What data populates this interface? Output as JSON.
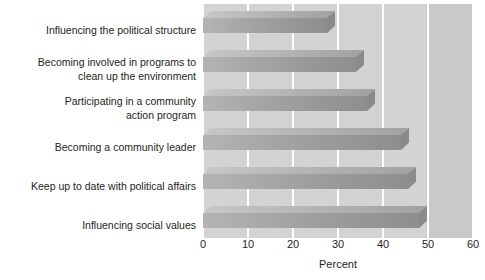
{
  "chart_data": {
    "type": "bar",
    "orientation": "horizontal",
    "title": "",
    "xlabel": "Percent",
    "ylabel": "",
    "xlim": [
      0,
      60
    ],
    "xticks": [
      0,
      10,
      20,
      30,
      40,
      50,
      60
    ],
    "grid": true,
    "legend": false,
    "categories": [
      "Influencing the political structure",
      "Becoming involved in programs to clean up the environment",
      "Participating in a community action program",
      "Becoming a community leader",
      "Keep up to date with political affairs",
      "Influencing social values"
    ],
    "category_lines": [
      [
        "Influencing the political structure"
      ],
      [
        "Becoming involved in programs to",
        "clean up the environment"
      ],
      [
        "Participating in a community",
        "action program"
      ],
      [
        "Becoming a community leader"
      ],
      [
        "Keep up to date with political affairs"
      ],
      [
        "Influencing social values"
      ]
    ],
    "values": [
      27.5,
      34,
      36.5,
      44,
      45.5,
      48
    ]
  },
  "style": {
    "plot_background": "#d3d3d3",
    "plot_background_right": "#c9c9c9",
    "gridline_color": "#ffffff",
    "bar_front_color": "#9d9d9d",
    "bar_top_color": "#b4b4b4",
    "bar_side_color": "#8a8a8a",
    "text_color": "#231f20",
    "page_background": "#ffffff"
  }
}
